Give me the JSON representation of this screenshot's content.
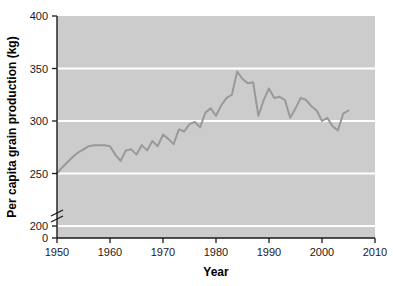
{
  "chart_data": {
    "type": "line",
    "title": "",
    "xlabel": "Year",
    "ylabel": "Per capita grain production (kg)",
    "xlim": [
      1950,
      2010
    ],
    "ylim": [
      200,
      400
    ],
    "y_axis_break": true,
    "y_break_between": [
      0,
      200
    ],
    "xticks": [
      1950,
      1960,
      1970,
      1980,
      1990,
      2000,
      2010
    ],
    "xtick_labels": [
      "1950",
      "1960",
      "1970",
      "1980",
      "1990",
      "2000",
      "2010"
    ],
    "yticks": [
      0,
      200,
      250,
      300,
      350,
      400
    ],
    "ytick_labels": [
      "0",
      "200",
      "250",
      "300",
      "350",
      "400"
    ],
    "gridlines": [
      200,
      250,
      300,
      350
    ],
    "grid": true,
    "legend": "none",
    "series": [
      {
        "name": "Per capita grain production",
        "color": "#999999",
        "x": [
          1950,
          1951,
          1952,
          1953,
          1954,
          1955,
          1956,
          1957,
          1958,
          1959,
          1960,
          1961,
          1962,
          1963,
          1964,
          1965,
          1966,
          1967,
          1968,
          1969,
          1970,
          1971,
          1972,
          1973,
          1974,
          1975,
          1976,
          1977,
          1978,
          1979,
          1980,
          1981,
          1982,
          1983,
          1984,
          1985,
          1986,
          1987,
          1988,
          1989,
          1990,
          1991,
          1992,
          1993,
          1994,
          1995,
          1996,
          1997,
          1998,
          1999,
          2000,
          2001,
          2002,
          2003,
          2004,
          2005
        ],
        "values": [
          250,
          256,
          261,
          266,
          270,
          273,
          276,
          277,
          277,
          277,
          276,
          268,
          262,
          272,
          273,
          268,
          277,
          272,
          281,
          276,
          287,
          283,
          278,
          292,
          290,
          297,
          299,
          294,
          308,
          312,
          305,
          315,
          322,
          325,
          347,
          340,
          336,
          337,
          305,
          320,
          331,
          322,
          323,
          320,
          303,
          312,
          322,
          320,
          314,
          310,
          300,
          303,
          295,
          291,
          307,
          310
        ]
      }
    ]
  },
  "axis": {
    "x_title": "Year",
    "y_title": "Per capita grain production (kg)"
  },
  "colors": {
    "plot_background": "#cccccc",
    "gridline": "#ffffff",
    "line": "#999999",
    "axis": "#1a1a1a",
    "page_background": "#ffffff"
  }
}
